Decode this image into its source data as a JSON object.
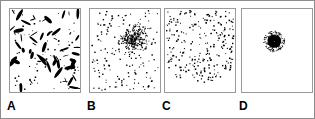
{
  "figure": {
    "background_color": "#ffffff",
    "ink_color": "#000000",
    "frame_color": "#8d8d8d",
    "panel_border_color": "#9a9a9a",
    "width": 315,
    "height": 119
  },
  "panels": [
    {
      "label": "A",
      "name": "panel-a-oriented-ellipses",
      "description": "Randomly oriented black elongated blobs with scattered small dots on white",
      "x": 8,
      "y": 7,
      "w": 72,
      "h": 85,
      "label_x": 6,
      "label_y": 99,
      "pattern": "random-oriented-ellipses",
      "element_count": 122
    },
    {
      "label": "B",
      "name": "panel-b-dot-cluster",
      "description": "Uniform scatter of small square dots with one dense cluster above and right of centre",
      "x": 88,
      "y": 7,
      "w": 72,
      "h": 85,
      "label_x": 86,
      "label_y": 99,
      "pattern": "uniform-scatter-with-cluster",
      "element_count": 430
    },
    {
      "label": "C",
      "name": "panel-c-radial-gradient-dots",
      "description": "Dots arranged in a radial density gradient, dense at centre thinning outward",
      "x": 163,
      "y": 7,
      "w": 72,
      "h": 85,
      "label_x": 161,
      "label_y": 99,
      "pattern": "radial-density-gradient",
      "element_count": 400
    },
    {
      "label": "D",
      "name": "panel-d-spiral-pinwheel",
      "description": "Black pinwheel spiral arms radiating from centre with dotted dashes overlaid",
      "x": 240,
      "y": 7,
      "w": 72,
      "h": 85,
      "label_x": 238,
      "label_y": 99,
      "pattern": "spiral-pinwheel",
      "element_count": 18
    }
  ]
}
